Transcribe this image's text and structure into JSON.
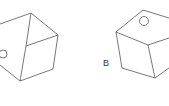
{
  "figures": [
    {
      "id": "A",
      "label": "",
      "description": "cube view with circle on left face"
    },
    {
      "id": "B",
      "label": "B",
      "description": "cube view with circle on top face"
    }
  ],
  "colors": {
    "stroke": "#555555",
    "background": "#ffffff"
  }
}
